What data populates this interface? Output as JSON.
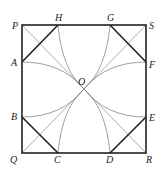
{
  "diagram": {
    "type": "geometry",
    "points": {
      "P": [
        22,
        25
      ],
      "H": [
        58,
        25
      ],
      "G": [
        110,
        25
      ],
      "S": [
        146,
        25
      ],
      "A": [
        22,
        62
      ],
      "F": [
        146,
        62
      ],
      "O": [
        84,
        89
      ],
      "B": [
        22,
        117
      ],
      "E": [
        146,
        117
      ],
      "Q": [
        22,
        153
      ],
      "C": [
        58,
        153
      ],
      "D": [
        110,
        153
      ],
      "R": [
        146,
        153
      ]
    },
    "labels": [
      {
        "text": "P",
        "x": 12,
        "y": 29
      },
      {
        "text": "H",
        "x": 55,
        "y": 21
      },
      {
        "text": "G",
        "x": 107,
        "y": 21
      },
      {
        "text": "S",
        "x": 149,
        "y": 29
      },
      {
        "text": "A",
        "x": 11,
        "y": 66
      },
      {
        "text": "F",
        "x": 149,
        "y": 68
      },
      {
        "text": "O",
        "x": 78,
        "y": 85
      },
      {
        "text": "B",
        "x": 11,
        "y": 120
      },
      {
        "text": "E",
        "x": 149,
        "y": 121
      },
      {
        "text": "Q",
        "x": 10,
        "y": 163
      },
      {
        "text": "C",
        "x": 54,
        "y": 163
      },
      {
        "text": "D",
        "x": 106,
        "y": 163
      },
      {
        "text": "R",
        "x": 146,
        "y": 163
      }
    ]
  }
}
